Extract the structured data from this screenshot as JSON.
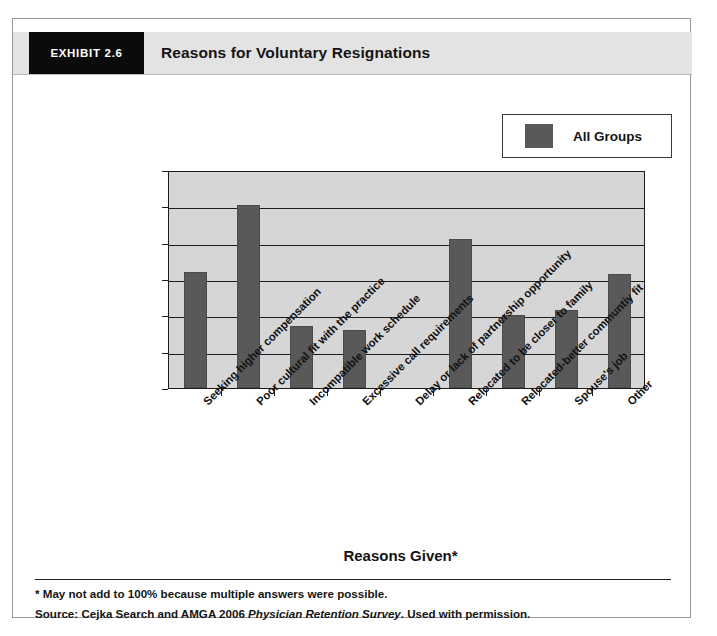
{
  "header": {
    "exhibit_tag": "EXHIBIT 2.6",
    "title": "Reasons for Voluntary Resignations"
  },
  "legend": {
    "position": "top-right",
    "entries": [
      {
        "label": "All Groups",
        "color": "#595959"
      }
    ]
  },
  "footnotes": {
    "asterisk_note": "* May not add to 100% because multiple answers were possible.",
    "source_prefix": "Source: Cejka Search and AMGA 2006 ",
    "source_italic": "Physician Retention Survey",
    "source_suffix": ". Used with permission."
  },
  "colors": {
    "bar": "#595959",
    "plot_background": "#d6d6d6",
    "axis": "#1c1c1c",
    "header_band": "#e3e3e3",
    "tag_background": "#0b0b0b"
  },
  "chart_data": {
    "type": "bar",
    "title": "Reasons for Voluntary Resignations",
    "xlabel": "Reasons Given*",
    "ylabel": "",
    "ylim": [
      0,
      60
    ],
    "ytick_values": [
      0,
      10,
      20,
      30,
      40,
      50,
      60
    ],
    "ytick_labels": [
      "0%",
      "10%",
      "20%",
      "30%",
      "40%",
      "50%",
      "60%"
    ],
    "grid": true,
    "legend_position": "top-right",
    "categories": [
      "Seeking higher compensation",
      "Poor cultural fit with the practice",
      "Incompatible work schedule",
      "Excessive call requirements",
      "Delay or lack of partnership opportunity",
      "Relocated to be closer to family",
      "Relocated-better communtiy fit",
      "Spouse's job",
      "Other"
    ],
    "series": [
      {
        "name": "All Groups",
        "color": "#595959",
        "values": [
          32,
          50.5,
          17,
          16,
          0,
          41,
          20,
          21.5,
          31.5
        ]
      }
    ]
  }
}
